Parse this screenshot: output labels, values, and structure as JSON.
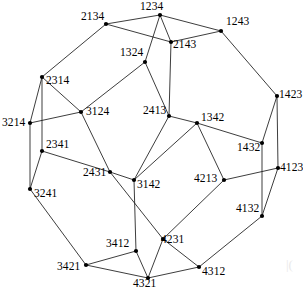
{
  "figure": {
    "width": 303,
    "height": 293,
    "background_color": "#ffffff",
    "edge_color": "#1a1a1a",
    "vertex_color": "#000000",
    "label_color": "#000000",
    "corner_artifact": "|("
  },
  "graph_data": {
    "type": "graph",
    "vertex_count": 24,
    "edge_count": 36,
    "vertices": [
      {
        "id": "1234",
        "label": "1234",
        "x": 160,
        "y": 15,
        "label_x": 140,
        "label_y": 1,
        "label_anchor": "start"
      },
      {
        "id": "2134",
        "label": "2134",
        "x": 106,
        "y": 24,
        "label_x": 81,
        "label_y": 11,
        "label_anchor": "start"
      },
      {
        "id": "1243",
        "label": "1243",
        "x": 221,
        "y": 31,
        "label_x": 226,
        "label_y": 16,
        "label_anchor": "start"
      },
      {
        "id": "2143",
        "label": "2143",
        "x": 171,
        "y": 42,
        "label_x": 173,
        "label_y": 39,
        "label_anchor": "start"
      },
      {
        "id": "1324",
        "label": "1324",
        "x": 145,
        "y": 62,
        "label_x": 120,
        "label_y": 47,
        "label_anchor": "start"
      },
      {
        "id": "2314",
        "label": "2314",
        "x": 42,
        "y": 77,
        "label_x": 46,
        "label_y": 75,
        "label_anchor": "start"
      },
      {
        "id": "1423",
        "label": "1423",
        "x": 277,
        "y": 96,
        "label_x": 279,
        "label_y": 89,
        "label_anchor": "start"
      },
      {
        "id": "3124",
        "label": "3124",
        "x": 81,
        "y": 112,
        "label_x": 86,
        "label_y": 106,
        "label_anchor": "start"
      },
      {
        "id": "2413",
        "label": "2413",
        "x": 169,
        "y": 116,
        "label_x": 143,
        "label_y": 105,
        "label_anchor": "start"
      },
      {
        "id": "3214",
        "label": "3214",
        "x": 30,
        "y": 123,
        "label_x": 2,
        "label_y": 117,
        "label_anchor": "start"
      },
      {
        "id": "1342",
        "label": "1342",
        "x": 197,
        "y": 123,
        "label_x": 201,
        "label_y": 112,
        "label_anchor": "start"
      },
      {
        "id": "1432",
        "label": "1432",
        "x": 262,
        "y": 143,
        "label_x": 237,
        "label_y": 142,
        "label_anchor": "start"
      },
      {
        "id": "2341",
        "label": "2341",
        "x": 42,
        "y": 151,
        "label_x": 46,
        "label_y": 139,
        "label_anchor": "start"
      },
      {
        "id": "2431",
        "label": "2431",
        "x": 110,
        "y": 172,
        "label_x": 83,
        "label_y": 167,
        "label_anchor": "start"
      },
      {
        "id": "4123",
        "label": "4123",
        "x": 278,
        "y": 168,
        "label_x": 280,
        "label_y": 162,
        "label_anchor": "start"
      },
      {
        "id": "3142",
        "label": "3142",
        "x": 134,
        "y": 180,
        "label_x": 137,
        "label_y": 179,
        "label_anchor": "start"
      },
      {
        "id": "4213",
        "label": "4213",
        "x": 224,
        "y": 180,
        "label_x": 194,
        "label_y": 173,
        "label_anchor": "start"
      },
      {
        "id": "3241",
        "label": "3241",
        "x": 30,
        "y": 189,
        "label_x": 34,
        "label_y": 188,
        "label_anchor": "start"
      },
      {
        "id": "4132",
        "label": "4132",
        "x": 262,
        "y": 216,
        "label_x": 236,
        "label_y": 203,
        "label_anchor": "start"
      },
      {
        "id": "4231",
        "label": "4231",
        "x": 163,
        "y": 239,
        "label_x": 161,
        "label_y": 234,
        "label_anchor": "start"
      },
      {
        "id": "3412",
        "label": "3412",
        "x": 136,
        "y": 251,
        "label_x": 106,
        "label_y": 238,
        "label_anchor": "start"
      },
      {
        "id": "3421",
        "label": "3421",
        "x": 86,
        "y": 265,
        "label_x": 57,
        "label_y": 261,
        "label_anchor": "start"
      },
      {
        "id": "4312",
        "label": "4312",
        "x": 199,
        "y": 267,
        "label_x": 202,
        "label_y": 266,
        "label_anchor": "start"
      },
      {
        "id": "4321",
        "label": "4321",
        "x": 148,
        "y": 278,
        "label_x": 133,
        "label_y": 278,
        "label_anchor": "start"
      }
    ],
    "edges": [
      [
        "1234",
        "2134"
      ],
      [
        "1234",
        "1243"
      ],
      [
        "1234",
        "2143"
      ],
      [
        "1234",
        "1324"
      ],
      [
        "2134",
        "2143"
      ],
      [
        "2134",
        "2314"
      ],
      [
        "1243",
        "2143"
      ],
      [
        "1243",
        "1423"
      ],
      [
        "2143",
        "2413"
      ],
      [
        "1324",
        "3124"
      ],
      [
        "1324",
        "2413"
      ],
      [
        "2314",
        "3214"
      ],
      [
        "2314",
        "3124"
      ],
      [
        "2314",
        "2341"
      ],
      [
        "1423",
        "1432"
      ],
      [
        "1423",
        "4123"
      ],
      [
        "3124",
        "3214"
      ],
      [
        "3124",
        "2431"
      ],
      [
        "2413",
        "1342"
      ],
      [
        "2413",
        "3142"
      ],
      [
        "3214",
        "3241"
      ],
      [
        "1342",
        "1432"
      ],
      [
        "1342",
        "3142"
      ],
      [
        "1342",
        "4213"
      ],
      [
        "1432",
        "4132"
      ],
      [
        "2341",
        "2431"
      ],
      [
        "2341",
        "3241"
      ],
      [
        "4123",
        "4213"
      ],
      [
        "4123",
        "4132"
      ],
      [
        "2431",
        "3142"
      ],
      [
        "2431",
        "4231"
      ],
      [
        "3142",
        "3412"
      ],
      [
        "4213",
        "4231"
      ],
      [
        "3241",
        "3421"
      ],
      [
        "4132",
        "4312"
      ],
      [
        "4231",
        "4321"
      ],
      [
        "3412",
        "3421"
      ],
      [
        "3412",
        "4321"
      ],
      [
        "3421",
        "4321"
      ],
      [
        "4312",
        "4321"
      ],
      [
        "4312",
        "4231"
      ]
    ]
  }
}
